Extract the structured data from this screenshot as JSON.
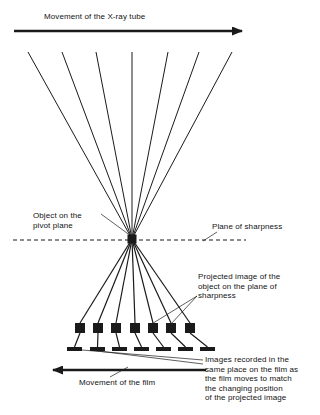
{
  "figure": {
    "type": "diagram",
    "background_color": "#ffffff",
    "line_color": "#1a1a1a",
    "marker_color": "#1a1a1a"
  },
  "labels": {
    "tube_movement": "Movement of the X-ray tube",
    "object_pivot": "Object on the\npivot plane",
    "plane_of_sharpness": "Plane of sharpness",
    "projected_image": "Projected image of the\nobject on the plane of\nsharpness",
    "images_recorded": "Images recorded in the\nsame place on the film as\nthe film moves to match\nthe changing position\nof the projected image",
    "film_movement": "Movement of the film"
  },
  "geometry": {
    "pivot_point": {
      "x": 132,
      "y": 239,
      "size": 9
    },
    "tube_arrow": {
      "x1": 14,
      "y1": 31,
      "x2": 248,
      "y2": 31,
      "direction": "right"
    },
    "film_arrow": {
      "x1": 206,
      "y1": 370,
      "x2": 47,
      "y2": 370,
      "direction": "left"
    },
    "plane_line": {
      "x1": 13,
      "y1": 240,
      "x2": 246,
      "y2": 240,
      "style": "dashed"
    },
    "ray_top_x": [
      28,
      62,
      96,
      132,
      168,
      199,
      232
    ],
    "ray_top_y": 52,
    "square_x": [
      75,
      93,
      111,
      130,
      148,
      166,
      185
    ],
    "square_y": 323,
    "square_size": 10,
    "film_mark_x": [
      67,
      90,
      112,
      134,
      156,
      178,
      200
    ],
    "film_mark_y": 347,
    "film_mark_width": 15,
    "film_mark_height": 4,
    "leader_lines": [
      {
        "name": "object-leader",
        "x1": 101,
        "y1": 214,
        "x2": 131,
        "y2": 236
      },
      {
        "name": "plane-leader",
        "x1": 217,
        "y1": 232,
        "x2": 203,
        "y2": 241
      },
      {
        "name": "projected-leader-a",
        "x1": 197,
        "y1": 296,
        "x2": 170,
        "y2": 325
      },
      {
        "name": "projected-leader-b",
        "x1": 197,
        "y1": 296,
        "x2": 150,
        "y2": 325
      },
      {
        "name": "recorded-leader-a",
        "x1": 203,
        "y1": 360,
        "x2": 70,
        "y2": 349
      },
      {
        "name": "recorded-leader-b",
        "x1": 203,
        "y1": 364,
        "x2": 90,
        "y2": 350
      },
      {
        "name": "film-leader",
        "x1": 110,
        "y1": 377,
        "x2": 128,
        "y2": 367
      }
    ]
  }
}
